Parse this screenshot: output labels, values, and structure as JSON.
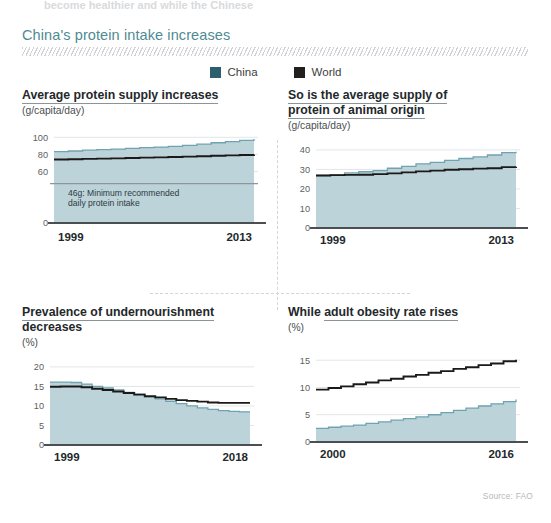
{
  "header": {
    "clipped_top_text": "become healthier and while the Chinese",
    "title": "China's protein intake increases",
    "title_color": "#4f8a93"
  },
  "legend": {
    "items": [
      {
        "label": "China",
        "color": "#2c5f6d",
        "key": "china"
      },
      {
        "label": "World",
        "color": "#231f1c",
        "key": "world"
      }
    ]
  },
  "footer": {
    "source": "Source: FAO"
  },
  "colors": {
    "china_fill": "#bcd3d9",
    "china_line": "#6fa3b0",
    "world_line": "#1c1a18",
    "axis": "#4a4f52",
    "grid": "#e2e6e8",
    "ref_line": "#8d979b"
  },
  "chart_data": [
    {
      "id": "protein-supply",
      "type": "area",
      "title": "Average protein supply increases",
      "title_underline_text": "Average protein supply increases",
      "ylabel": "(g/capita/day)",
      "xlabel": "",
      "ylim": [
        0,
        105
      ],
      "yticks": [
        0,
        60,
        80,
        100
      ],
      "ytick_labels": [
        "0",
        "60",
        "80",
        "100"
      ],
      "x": [
        1999,
        2000,
        2001,
        2002,
        2003,
        2004,
        2005,
        2006,
        2007,
        2008,
        2009,
        2010,
        2011,
        2012,
        2013
      ],
      "xtick_labels": [
        "1999",
        "2013"
      ],
      "grid": true,
      "legend_position": "top-center",
      "series": [
        {
          "name": "China",
          "values": [
            83.2,
            84.0,
            85.0,
            85.6,
            86.2,
            87.0,
            88.0,
            88.6,
            89.4,
            90.6,
            92.0,
            93.6,
            95.0,
            96.4,
            98.0
          ]
        },
        {
          "name": "World",
          "values": [
            74.0,
            74.4,
            74.8,
            75.1,
            75.4,
            75.8,
            76.3,
            76.6,
            77.0,
            77.4,
            77.9,
            78.4,
            78.9,
            79.4,
            80.0
          ]
        }
      ],
      "annotations": [
        {
          "type": "hline",
          "value": 46,
          "text": "46g: Minimum recommended daily protein intake",
          "line1": "46g: Minimum recommended",
          "line2": "daily protein intake"
        }
      ]
    },
    {
      "id": "animal-protein",
      "type": "area",
      "title": "So is the average supply of protein of animal origin",
      "title_line1": "So is the average supply of",
      "title_line2": "protein of animal origin",
      "ylabel": "(g/capita/day)",
      "xlabel": "",
      "ylim": [
        0,
        42
      ],
      "yticks": [
        0,
        10,
        20,
        30,
        40
      ],
      "ytick_labels": [
        "0",
        "10",
        "20",
        "30",
        "40"
      ],
      "x": [
        1999,
        2000,
        2001,
        2002,
        2003,
        2004,
        2005,
        2006,
        2007,
        2008,
        2009,
        2010,
        2011,
        2012,
        2013
      ],
      "xtick_labels": [
        "1999",
        "2013"
      ],
      "grid": true,
      "series": [
        {
          "name": "China",
          "values": [
            26.9,
            27.2,
            28.2,
            28.8,
            29.4,
            30.6,
            31.6,
            32.8,
            33.6,
            34.6,
            35.6,
            36.4,
            37.4,
            38.6,
            39.0
          ]
        },
        {
          "name": "World",
          "values": [
            26.9,
            27.1,
            27.2,
            27.3,
            27.6,
            28.0,
            28.5,
            29.0,
            29.4,
            29.8,
            30.1,
            30.4,
            30.6,
            31.2,
            31.4
          ]
        }
      ],
      "annotations": []
    },
    {
      "id": "undernourishment",
      "type": "area",
      "title": "Prevalence of undernourishment decreases",
      "title_line1": "Prevalence of undernourishment",
      "title_line2": "decreases",
      "ylabel": "(%)",
      "xlabel": "",
      "ylim": [
        0,
        21
      ],
      "yticks": [
        0,
        5,
        10,
        15,
        20
      ],
      "ytick_labels": [
        "0",
        "5",
        "10",
        "15",
        "20"
      ],
      "x": [
        1999,
        2000,
        2001,
        2002,
        2003,
        2004,
        2005,
        2006,
        2007,
        2008,
        2009,
        2010,
        2011,
        2012,
        2013,
        2014,
        2015,
        2016,
        2017,
        2018
      ],
      "xtick_labels": [
        "1999",
        "2018"
      ],
      "grid": true,
      "series": [
        {
          "name": "China",
          "values": [
            16.1,
            16.1,
            16.0,
            15.6,
            15.0,
            14.6,
            14.1,
            13.5,
            13.0,
            12.4,
            11.8,
            11.2,
            10.6,
            10.0,
            9.5,
            9.1,
            8.8,
            8.6,
            8.5,
            8.5
          ]
        },
        {
          "name": "World",
          "values": [
            14.9,
            15.0,
            15.0,
            14.8,
            14.4,
            14.1,
            13.7,
            13.3,
            12.9,
            12.5,
            12.2,
            11.8,
            11.5,
            11.3,
            11.1,
            10.9,
            10.8,
            10.8,
            10.8,
            10.8
          ]
        }
      ],
      "annotations": []
    },
    {
      "id": "obesity",
      "type": "area",
      "title": "While adult obesity rate rises",
      "title_plain": "While ",
      "title_underlined": "adult obesity rate rises",
      "ylabel": "(%)",
      "xlabel": "",
      "ylim": [
        0,
        16.5
      ],
      "yticks": [
        0,
        5,
        10,
        15
      ],
      "ytick_labels": [
        "0",
        "5",
        "10",
        "15"
      ],
      "x": [
        2000,
        2001,
        2002,
        2003,
        2004,
        2005,
        2006,
        2007,
        2008,
        2009,
        2010,
        2011,
        2012,
        2013,
        2014,
        2015,
        2016
      ],
      "xtick_labels": [
        "2000",
        "2016"
      ],
      "grid": true,
      "series": [
        {
          "name": "China",
          "values": [
            2.5,
            2.7,
            2.9,
            3.1,
            3.4,
            3.7,
            4.0,
            4.3,
            4.6,
            5.0,
            5.4,
            5.8,
            6.2,
            6.6,
            7.0,
            7.4,
            7.8
          ]
        },
        {
          "name": "World",
          "values": [
            9.6,
            9.9,
            10.2,
            10.6,
            10.9,
            11.3,
            11.6,
            12.0,
            12.3,
            12.7,
            13.0,
            13.4,
            13.7,
            14.1,
            14.4,
            14.8,
            15.1
          ]
        }
      ],
      "annotations": []
    }
  ]
}
